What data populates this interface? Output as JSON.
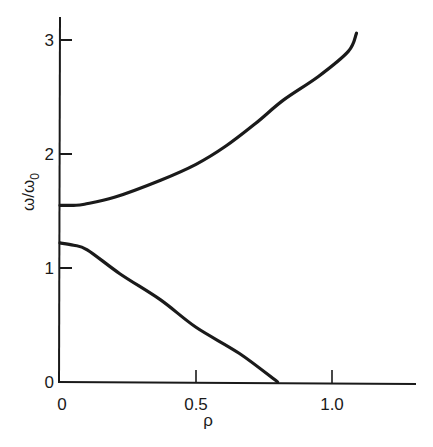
{
  "chart_data": {
    "type": "line",
    "title": "",
    "xlabel": "ρ",
    "ylabel": "ω/ω0",
    "ylabel_main": "ω/ω",
    "ylabel_sub": "0",
    "xlim": [
      0,
      1.3
    ],
    "ylim": [
      0,
      3.2
    ],
    "grid": false,
    "legend": null,
    "x_ticks": [
      0,
      0.5,
      1.0
    ],
    "x_tick_labels": [
      "0",
      "0.5",
      "1.0"
    ],
    "y_ticks": [
      0,
      1,
      2,
      3
    ],
    "y_tick_labels": [
      "0",
      "1",
      "2",
      "3"
    ],
    "series": [
      {
        "name": "upper branch",
        "color": "#1a1a1a",
        "x": [
          0,
          0.05,
          0.09,
          0.2,
          0.37,
          0.5,
          0.61,
          0.72,
          0.82,
          0.95,
          1.06,
          1.09
        ],
        "y": [
          1.55,
          1.55,
          1.56,
          1.62,
          1.77,
          1.91,
          2.07,
          2.27,
          2.47,
          2.68,
          2.9,
          3.06
        ]
      },
      {
        "name": "lower branch",
        "color": "#1a1a1a",
        "x": [
          0,
          0.05,
          0.1,
          0.22,
          0.37,
          0.5,
          0.66,
          0.8
        ],
        "y": [
          1.22,
          1.2,
          1.16,
          0.95,
          0.72,
          0.48,
          0.25,
          0.0
        ]
      }
    ]
  }
}
